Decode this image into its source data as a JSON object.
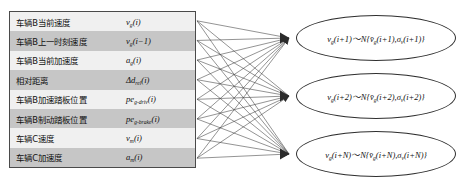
{
  "diagram": {
    "colors": {
      "row_light": "#f0f0f0",
      "row_dark": "#c6c6c6",
      "border": "#4a4a4a",
      "edge": "#3a3a3a",
      "node_fill": "#ffffff",
      "text": "#111111"
    }
  },
  "input_table": {
    "rows": [
      {
        "label": "车辆B当前速度",
        "symbol_html": "v<sub>g</sub>(i)",
        "shade": "light"
      },
      {
        "label": "车辆B上一时刻速度",
        "symbol_html": "v<sub>g</sub>(i−1)",
        "shade": "dark"
      },
      {
        "label": "车辆B当前加速度",
        "symbol_html": "a<sub>g</sub>(i)",
        "shade": "light"
      },
      {
        "label": "相对距离",
        "symbol_html": "Δd<sub>rel</sub>(i)",
        "shade": "dark"
      },
      {
        "label": "车辆B加速踏板位置",
        "symbol_html": "pe<sub>g-driv</sub>(i)",
        "shade": "light"
      },
      {
        "label": "车辆B制动踏板位置",
        "symbol_html": "pe<sub>g-brake</sub>(i)",
        "shade": "dark"
      },
      {
        "label": "车辆C速度",
        "symbol_html": "v<sub>m</sub>(i)",
        "shade": "light"
      },
      {
        "label": "车辆C加速度",
        "symbol_html": "a<sub>m</sub>(i)",
        "shade": "dark"
      }
    ]
  },
  "output_nodes": [
    {
      "formula_html": "v<sub>g</sub>(i+1)～N{v̄<sub>g</sub>(i+1),σ<sub>v</sub>(i+1)}",
      "step": "i+1"
    },
    {
      "formula_html": "v<sub>g</sub>(i+2)～N{v̄<sub>g</sub>(i+2),σ<sub>v</sub>(i+2)}",
      "step": "i+2"
    },
    {
      "formula_html": "v<sub>g</sub>(i+N)～N{v̄<sub>g</sub>(i+N),σ<sub>v</sub>(i+N)}",
      "step": "i+N"
    }
  ],
  "edges": {
    "description": "fully connected: 8 input features to 3 output nodes",
    "input_count": 8,
    "output_count": 3,
    "total": 24
  }
}
